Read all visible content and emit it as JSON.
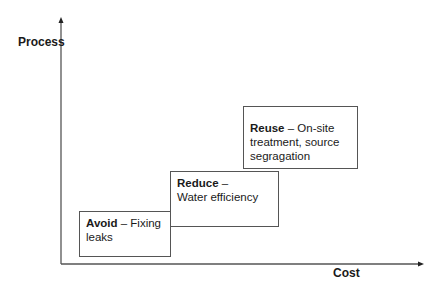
{
  "axes": {
    "y_label": "Process",
    "x_label": "Cost"
  },
  "boxes": [
    {
      "title": "Avoid",
      "separator": " – ",
      "text": "Fixing leaks"
    },
    {
      "title": "Reduce",
      "separator": " – ",
      "text": "Water efficiency"
    },
    {
      "title": "Reuse",
      "separator": " – ",
      "text": "On-site treatment, source segragation"
    }
  ]
}
